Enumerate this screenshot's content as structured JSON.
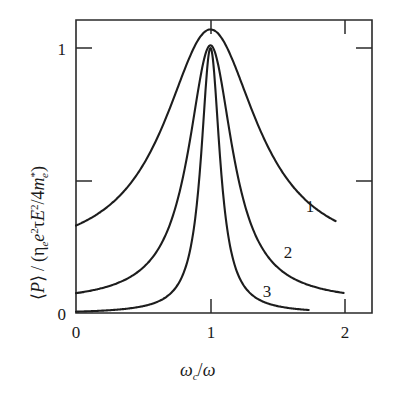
{
  "figure": {
    "background_color": "#ffffff",
    "line_color": "#1d1d1d"
  },
  "chart_data": {
    "type": "line",
    "title": "",
    "subtitle": "",
    "xlabel": "ωc/ω",
    "ylabel": "⟨P⟩ / (ηe e²τE²/4m*e)",
    "xlim": [
      0,
      2.15
    ],
    "ylim": [
      0,
      1.18
    ],
    "xticks": [
      0,
      1,
      2
    ],
    "xtick_labels": [
      "0",
      "1",
      "2"
    ],
    "yticks": [
      0,
      0.5,
      1
    ],
    "ytick_labels": [
      "0",
      "",
      "1"
    ],
    "grid": false,
    "legend": "inline-curve-labels",
    "annotations": [
      {
        "text": "1",
        "x": 1.74,
        "y": 0.41
      },
      {
        "text": "2",
        "x": 1.57,
        "y": 0.23
      },
      {
        "text": "3",
        "x": 1.42,
        "y": 0.08
      }
    ],
    "series": [
      {
        "name": "1",
        "label": "1",
        "description": "broadest resonance, largest damping",
        "peak_x": 1.0,
        "peak_y": 1.07,
        "half_width": 0.42,
        "x_start": 0.0,
        "x_end": 1.93,
        "y_at_x0": 0.33,
        "y_at_xend": 0.21,
        "x": [
          0.0,
          0.1,
          0.2,
          0.3,
          0.4,
          0.5,
          0.6,
          0.7,
          0.8,
          0.9,
          1.0,
          1.1,
          1.2,
          1.3,
          1.4,
          1.5,
          1.6,
          1.7,
          1.8,
          1.93
        ],
        "y": [
          0.33,
          0.35,
          0.39,
          0.44,
          0.51,
          0.6,
          0.72,
          0.85,
          0.98,
          1.06,
          1.07,
          1.02,
          0.92,
          0.79,
          0.66,
          0.54,
          0.44,
          0.35,
          0.28,
          0.21
        ]
      },
      {
        "name": "2",
        "label": "2",
        "description": "intermediate resonance width",
        "peak_x": 1.0,
        "peak_y": 1.01,
        "half_width": 0.2,
        "x_start": 0.0,
        "x_end": 1.99,
        "y_at_x0": 0.075,
        "y_at_xend": 0.03,
        "x": [
          0.0,
          0.1,
          0.2,
          0.3,
          0.4,
          0.5,
          0.6,
          0.7,
          0.8,
          0.9,
          1.0,
          1.1,
          1.2,
          1.3,
          1.4,
          1.5,
          1.6,
          1.7,
          1.8,
          1.9,
          1.99
        ],
        "y": [
          0.075,
          0.085,
          0.1,
          0.12,
          0.15,
          0.2,
          0.27,
          0.4,
          0.62,
          0.9,
          1.01,
          0.92,
          0.69,
          0.48,
          0.33,
          0.23,
          0.16,
          0.11,
          0.075,
          0.05,
          0.03
        ]
      },
      {
        "name": "3",
        "label": "3",
        "description": "sharpest resonance, smallest damping",
        "peak_x": 1.0,
        "peak_y": 1.0,
        "half_width": 0.085,
        "x_start": 0.0,
        "x_end": 1.73,
        "y_at_x0": 0.005,
        "y_at_xend": 0.01,
        "x": [
          0.0,
          0.15,
          0.3,
          0.45,
          0.6,
          0.7,
          0.8,
          0.88,
          0.94,
          1.0,
          1.06,
          1.12,
          1.2,
          1.3,
          1.4,
          1.55,
          1.73
        ],
        "y": [
          0.005,
          0.008,
          0.014,
          0.025,
          0.048,
          0.075,
          0.16,
          0.38,
          0.78,
          1.0,
          0.78,
          0.42,
          0.19,
          0.095,
          0.055,
          0.025,
          0.01
        ]
      }
    ]
  },
  "labels": {
    "xtick_0": "0",
    "xtick_1": "1",
    "xtick_2": "2",
    "ytick_0": "0",
    "ytick_1": "1",
    "curve_1": "1",
    "curve_2": "2",
    "curve_3": "3",
    "xaxis_omega": "ω",
    "xaxis_sub_c": "c",
    "xaxis_slash": "/",
    "xaxis_omega2": "ω",
    "yaxis_bracket_open": "⟨",
    "yaxis_P": "P",
    "yaxis_bracket_close": "⟩",
    "yaxis_slash": "/",
    "yaxis_paren_open": "(",
    "yaxis_eta": "η",
    "yaxis_eta_sub": "e",
    "yaxis_e": "e",
    "yaxis_e_sup": "2",
    "yaxis_tau": "τ",
    "yaxis_E": "E",
    "yaxis_E_sup": "2",
    "yaxis_slash2": "/",
    "yaxis_four": "4",
    "yaxis_m": "m",
    "yaxis_m_sup": "*",
    "yaxis_m_sub": "e",
    "yaxis_paren_close": ")"
  }
}
